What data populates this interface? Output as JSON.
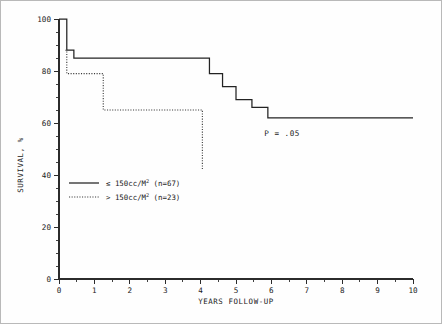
{
  "chart_data": {
    "type": "line",
    "title": "",
    "xlabel": "YEARS FOLLOW-UP",
    "ylabel": "SURVIVAL, %",
    "xlim": [
      0,
      10
    ],
    "ylim": [
      0,
      100
    ],
    "grid": false,
    "x_ticks": [
      "0",
      "1",
      "2",
      "3",
      "4",
      "5",
      "6",
      "7",
      "8",
      "9",
      "10"
    ],
    "y_ticks": [
      "0",
      "20",
      "40",
      "60",
      "80",
      "100"
    ],
    "x_minor_tick_step": 0.5,
    "y_minor_tick_step": 5,
    "legend_position": "lower-left",
    "annotations": [
      {
        "name": "p-value",
        "text": "P = .05",
        "x": 5.8,
        "y": 55
      }
    ],
    "series": [
      {
        "name": "≤ 150cc/M² (n=67)",
        "label_main": "≤ 150cc/M",
        "label_sup": "2",
        "label_n": "(n=67)",
        "style": "solid",
        "color": "#232323",
        "steps": [
          {
            "x": 0.0,
            "y": 100
          },
          {
            "x": 0.22,
            "y": 88
          },
          {
            "x": 0.42,
            "y": 85
          },
          {
            "x": 4.25,
            "y": 79
          },
          {
            "x": 4.62,
            "y": 74
          },
          {
            "x": 5.0,
            "y": 69
          },
          {
            "x": 5.45,
            "y": 66
          },
          {
            "x": 5.9,
            "y": 62
          },
          {
            "x": 10.0,
            "y": 62
          }
        ]
      },
      {
        "name": "> 150cc/M² (n=23)",
        "label_main": "> 150cc/M",
        "label_sup": "2",
        "label_n": "(n=23)",
        "style": "dotted",
        "color": "#3a3a3a",
        "steps": [
          {
            "x": 0.18,
            "y": 88
          },
          {
            "x": 0.22,
            "y": 79
          },
          {
            "x": 1.22,
            "y": 79
          },
          {
            "x": 1.25,
            "y": 65
          },
          {
            "x": 4.02,
            "y": 65
          },
          {
            "x": 4.05,
            "y": 42
          }
        ]
      }
    ]
  },
  "legend": {
    "items": [
      {
        "label_main": "≤ 150cc/M",
        "label_sup": "2",
        "label_n": "(n=67)",
        "style": "solid"
      },
      {
        "label_main": "> 150cc/M",
        "label_sup": "2",
        "label_n": "(n=23)",
        "style": "dotted"
      }
    ]
  },
  "axes": {
    "y_title": "SURVIVAL, %",
    "x_title": "YEARS FOLLOW-UP"
  }
}
